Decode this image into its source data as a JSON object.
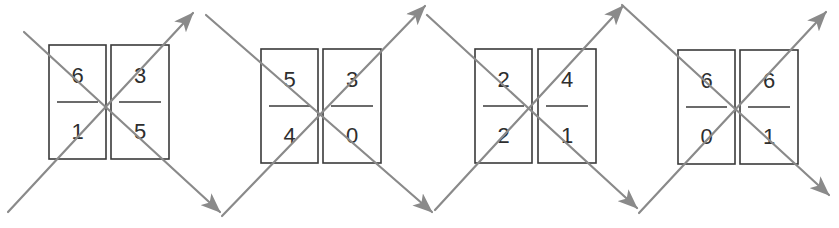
{
  "diagram": {
    "line_color": "#8a8a8a",
    "box_color": "#3a3a3a",
    "groups": [
      {
        "id": "group-1",
        "cards": [
          {
            "numerator": "6",
            "denominator": "1",
            "x": 49,
            "y": 45,
            "w": 57,
            "h": 114
          },
          {
            "numerator": "3",
            "denominator": "5",
            "x": 111,
            "y": 45,
            "w": 58,
            "h": 114
          }
        ],
        "center": [
          108,
          106
        ]
      },
      {
        "id": "group-2",
        "cards": [
          {
            "numerator": "5",
            "denominator": "4",
            "x": 261,
            "y": 49,
            "w": 57,
            "h": 114
          },
          {
            "numerator": "3",
            "denominator": "0",
            "x": 323,
            "y": 49,
            "w": 58,
            "h": 114
          }
        ],
        "center": [
          320,
          112
        ]
      },
      {
        "id": "group-3",
        "cards": [
          {
            "numerator": "2",
            "denominator": "2",
            "x": 475,
            "y": 49,
            "w": 57,
            "h": 114
          },
          {
            "numerator": "4",
            "denominator": "1",
            "x": 538,
            "y": 49,
            "w": 58,
            "h": 114
          }
        ],
        "center": [
          530,
          107
        ]
      },
      {
        "id": "group-4",
        "cards": [
          {
            "numerator": "6",
            "denominator": "0",
            "x": 678,
            "y": 50,
            "w": 57,
            "h": 114
          },
          {
            "numerator": "6",
            "denominator": "1",
            "x": 740,
            "y": 50,
            "w": 58,
            "h": 114
          }
        ],
        "center": [
          737,
          110
        ]
      }
    ],
    "arrows": [
      {
        "from": [
          24,
          32
        ],
        "to": [
          220,
          212
        ]
      },
      {
        "from": [
          8,
          212
        ],
        "to": [
          193,
          13
        ]
      },
      {
        "from": [
          206,
          15
        ],
        "to": [
          432,
          212
        ]
      },
      {
        "from": [
          222,
          216
        ],
        "to": [
          425,
          6
        ]
      },
      {
        "from": [
          427,
          15
        ],
        "to": [
          637,
          208
        ]
      },
      {
        "from": [
          435,
          210
        ],
        "to": [
          623,
          6
        ]
      },
      {
        "from": [
          622,
          5
        ],
        "to": [
          829,
          195
        ]
      },
      {
        "from": [
          639,
          213
        ],
        "to": [
          826,
          12
        ]
      }
    ]
  }
}
